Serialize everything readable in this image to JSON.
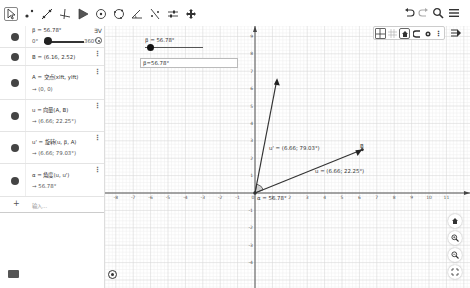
{
  "toolbar": {
    "tools": [
      {
        "name": "move-tool",
        "active": true
      },
      {
        "name": "point-tool"
      },
      {
        "name": "line-tool"
      },
      {
        "name": "perpendicular-line-tool"
      },
      {
        "name": "polygon-tool"
      },
      {
        "name": "circle-center-tool"
      },
      {
        "name": "circle-three-points-tool"
      },
      {
        "name": "angle-tool"
      },
      {
        "name": "reflect-tool"
      },
      {
        "name": "slider-tool"
      },
      {
        "name": "move-graphics-view-tool"
      }
    ],
    "right": [
      {
        "name": "undo-button"
      },
      {
        "name": "redo-button"
      },
      {
        "name": "search-button"
      },
      {
        "name": "menu-button"
      }
    ]
  },
  "algebra": {
    "slider": {
      "label": "β = 56.78°",
      "min": "0°",
      "max": "360°",
      "value": 56.78
    },
    "rows": [
      {
        "def": "B = (6.16, 2.52)"
      },
      {
        "def": "A = 交点(xlft, ylft)",
        "value": "→  (0, 0)"
      },
      {
        "def": "u = 向量(A, B)",
        "value": "→  (6.66; 22.25°)"
      },
      {
        "def": "u' = 旋转(u, β, A)",
        "value": "→  (6.66; 79.03°)"
      },
      {
        "def": "α = 角度(u, u')",
        "value": "→  56.78°"
      }
    ],
    "input_placeholder": "输入...",
    "add_symbol": "+"
  },
  "graphics": {
    "slider_label": "β = 56.78°",
    "input_box_value": "β=56.78°",
    "x_ticks": [
      "-8",
      "-7",
      "-6",
      "-5",
      "-4",
      "-3",
      "-2",
      "-1",
      "0",
      "1",
      "2",
      "3",
      "4",
      "5",
      "6",
      "7",
      "8",
      "9",
      "10",
      "11"
    ],
    "y_ticks": [
      "9",
      "8",
      "7",
      "6",
      "5",
      "4",
      "3",
      "2",
      "1",
      "-1",
      "-2",
      "-3",
      "-4"
    ],
    "points": {
      "B": {
        "label": "B",
        "x": 6.16,
        "y": 2.52
      }
    },
    "vectors": {
      "u": {
        "label": "u = (6.66; 22.25°)"
      },
      "u_prime": {
        "label": "u' = (6.66; 79.03°)"
      }
    },
    "angle_label": "α = 56.78°",
    "origin_label": "0"
  }
}
